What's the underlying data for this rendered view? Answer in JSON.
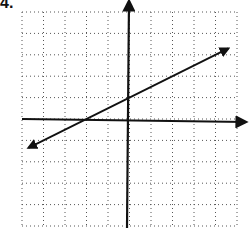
{
  "problem": {
    "number_label": "4."
  },
  "chart_data": {
    "type": "line",
    "title": "",
    "xlabel": "",
    "ylabel": "",
    "xlim": [
      -5,
      5
    ],
    "ylim": [
      -5,
      5
    ],
    "grid": true,
    "grid_style": "dotted",
    "tick_labels": "none",
    "series": [
      {
        "name": "line",
        "equation": "y = 0.5x + 1",
        "slope": 0.5,
        "intercept": 1,
        "x": [
          -5,
          -2,
          0,
          5
        ],
        "y": [
          -1.5,
          0,
          1,
          3.5
        ],
        "arrows_both_ends": true
      }
    ]
  }
}
